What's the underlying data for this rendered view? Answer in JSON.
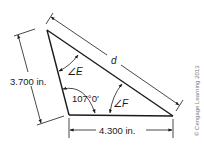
{
  "diagram": {
    "type": "triangle-geometry",
    "side_left": {
      "label": "3.700 in."
    },
    "side_bottom": {
      "label": "4.300 in."
    },
    "side_hypotenuse": {
      "label": "d"
    },
    "included_angle": {
      "label": "107°0′"
    },
    "angle_e": {
      "label": "∠E"
    },
    "angle_f": {
      "label": "∠F"
    },
    "copyright": "© Cengage Learning 2013",
    "colors": {
      "line": "#1a1a1a",
      "copyright": "#7a7a7a",
      "background": "#ffffff"
    }
  }
}
